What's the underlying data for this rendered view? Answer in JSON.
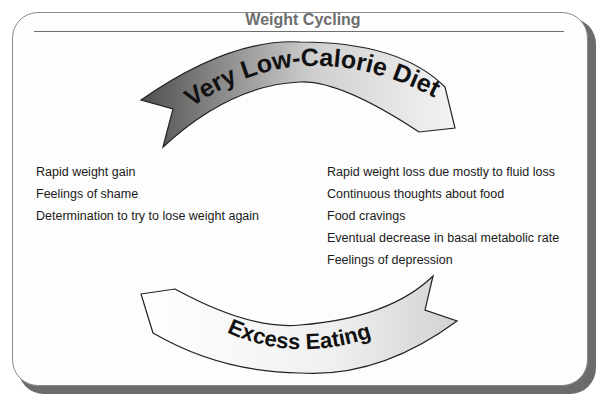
{
  "title": "Weight Cycling",
  "arrows": {
    "top": {
      "label": "Very Low-Calorie Diet",
      "fill_start": "#5a5a5a",
      "fill_end": "#f2f2f2"
    },
    "bottom": {
      "label": "Excess Eating",
      "fill_start": "#ffffff",
      "fill_end": "#d9d9d9"
    }
  },
  "left_list": {
    "items": [
      "Rapid weight gain",
      "Feelings of shame",
      "Determination to try to lose weight again"
    ]
  },
  "right_list": {
    "items": [
      "Rapid weight loss due mostly to fluid loss",
      "Continuous thoughts about food",
      "Food cravings",
      "Eventual decrease in basal metabolic rate",
      "Feelings of depression"
    ]
  },
  "colors": {
    "frame_border": "#8a8a8a",
    "frame_shadow": "#6b6b6b",
    "title": "#6e6e6e",
    "text": "#1a1a1a"
  }
}
